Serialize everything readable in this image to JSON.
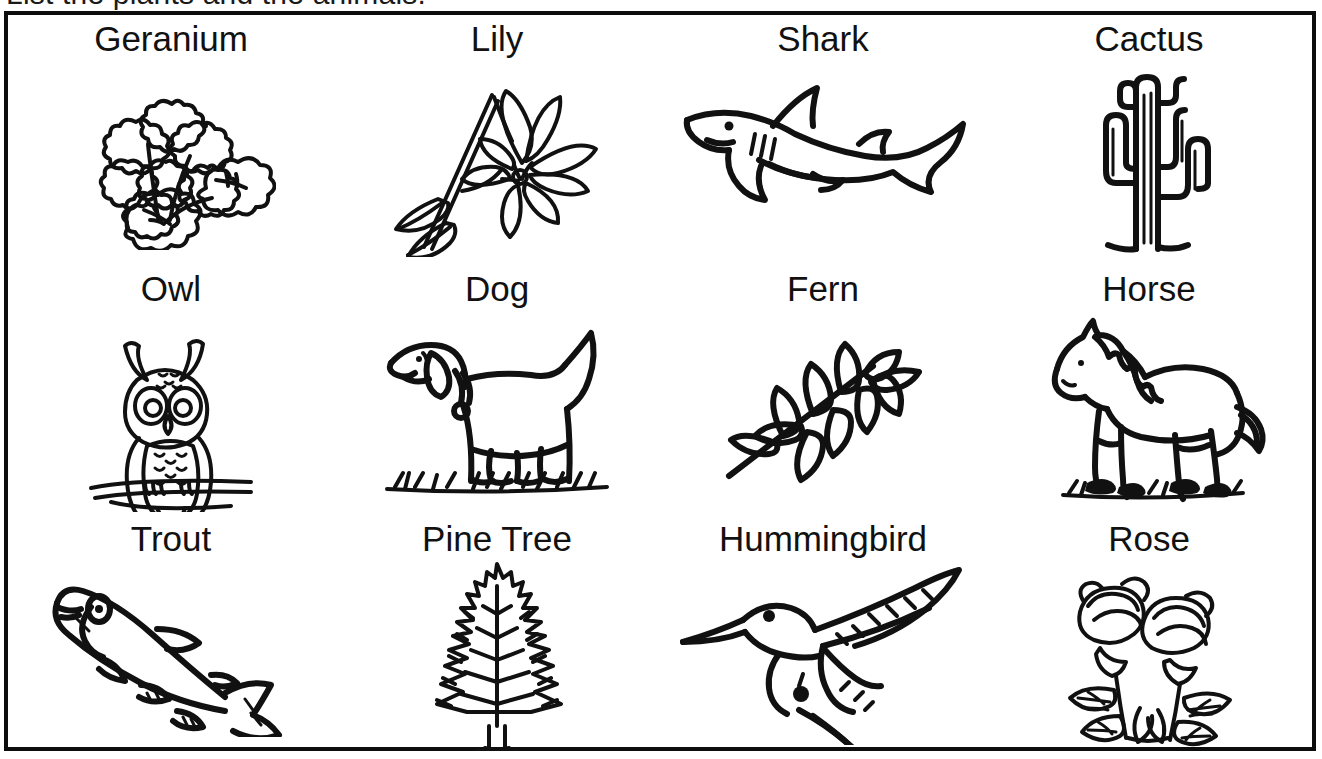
{
  "page": {
    "instruction_text": "List the plants and the animals.",
    "border_color": "#0d0d0d",
    "ink_color": "#111111",
    "background_color": "#ffffff"
  },
  "worksheet": {
    "columns": 4,
    "rows": 3,
    "items": [
      {
        "label": "Geranium",
        "icon": "geranium-illustration",
        "category": "plant"
      },
      {
        "label": "Lily",
        "icon": "lily-illustration",
        "category": "plant"
      },
      {
        "label": "Shark",
        "icon": "shark-illustration",
        "category": "animal"
      },
      {
        "label": "Cactus",
        "icon": "cactus-illustration",
        "category": "plant"
      },
      {
        "label": "Owl",
        "icon": "owl-illustration",
        "category": "animal"
      },
      {
        "label": "Dog",
        "icon": "dog-illustration",
        "category": "animal"
      },
      {
        "label": "Fern",
        "icon": "fern-illustration",
        "category": "plant"
      },
      {
        "label": "Horse",
        "icon": "horse-illustration",
        "category": "animal"
      },
      {
        "label": "Trout",
        "icon": "trout-illustration",
        "category": "animal"
      },
      {
        "label": "Pine Tree",
        "icon": "pine-tree-illustration",
        "category": "plant"
      },
      {
        "label": "Hummingbird",
        "icon": "hummingbird-illustration",
        "category": "animal"
      },
      {
        "label": "Rose",
        "icon": "rose-illustration",
        "category": "plant"
      }
    ]
  }
}
